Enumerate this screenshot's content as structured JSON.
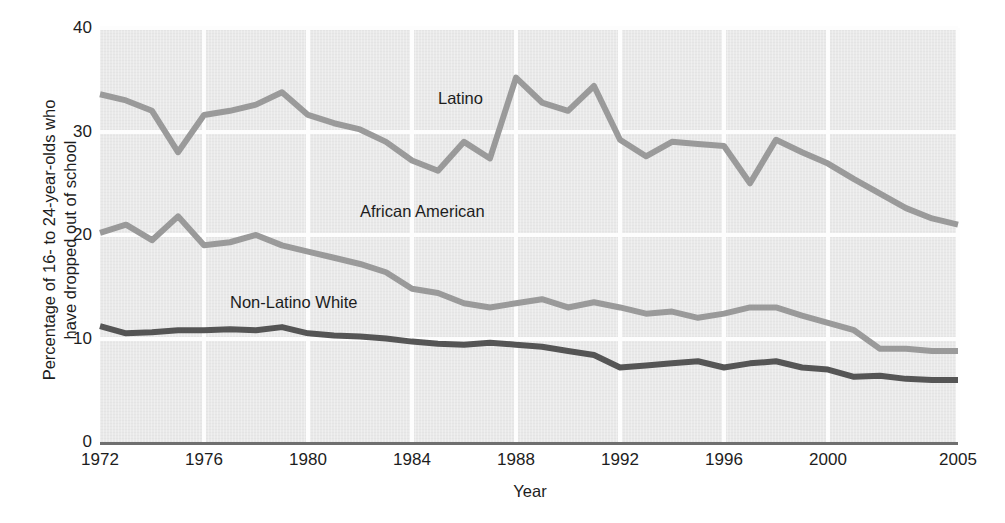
{
  "chart_data": {
    "type": "line",
    "title": "",
    "xlabel": "Year",
    "ylabel_line1": "Percentage of 16- to 24-year-olds who",
    "ylabel_line2": "have dropped out of school",
    "xlim": [
      1972,
      2005
    ],
    "ylim": [
      0,
      40
    ],
    "xticks": [
      "1972",
      "1976",
      "1980",
      "1984",
      "1988",
      "1992",
      "1996",
      "2000",
      "2005"
    ],
    "xtick_values": [
      1972,
      1976,
      1980,
      1984,
      1988,
      1992,
      1996,
      2000,
      2005
    ],
    "yticks": [
      "0",
      "10",
      "20",
      "30",
      "40"
    ],
    "ytick_values": [
      0,
      10,
      20,
      30,
      40
    ],
    "grid": "both-major-white",
    "legend": "inline-labels",
    "x": [
      1972,
      1973,
      1974,
      1975,
      1976,
      1977,
      1978,
      1979,
      1980,
      1981,
      1982,
      1983,
      1984,
      1985,
      1986,
      1987,
      1988,
      1989,
      1990,
      1991,
      1992,
      1993,
      1994,
      1995,
      1996,
      1997,
      1998,
      1999,
      2000,
      2001,
      2002,
      2003,
      2004,
      2005
    ],
    "series": [
      {
        "name": "Latino",
        "color": "#9a9a9a",
        "label_x": 1985.0,
        "label_y": 33.0,
        "values": [
          33.6,
          33.0,
          32.0,
          28.0,
          31.6,
          32.0,
          32.6,
          33.8,
          31.6,
          30.8,
          30.2,
          29.0,
          27.2,
          26.2,
          29.0,
          27.4,
          35.2,
          32.8,
          32.0,
          34.4,
          29.2,
          27.6,
          29.0,
          28.8,
          28.6,
          25.0,
          29.2,
          28.0,
          26.9,
          25.4,
          24.0,
          22.6,
          21.6,
          21.0
        ]
      },
      {
        "name": "African American",
        "color": "#9a9a9a",
        "label_x": 1982.0,
        "label_y": 22.1,
        "values": [
          20.2,
          21.0,
          19.5,
          21.8,
          19.0,
          19.3,
          20.0,
          19.0,
          18.4,
          17.8,
          17.2,
          16.4,
          14.8,
          14.4,
          13.4,
          13.0,
          13.4,
          13.8,
          13.0,
          13.5,
          13.0,
          12.4,
          12.6,
          12.0,
          12.4,
          13.0,
          13.0,
          12.2,
          11.5,
          10.8,
          9.0,
          9.0,
          8.8,
          8.8
        ]
      },
      {
        "name": "Non-Latino White",
        "color": "#555555",
        "label_x": 1977.0,
        "label_y": 13.3,
        "values": [
          11.2,
          10.5,
          10.6,
          10.8,
          10.8,
          10.9,
          10.8,
          11.1,
          10.5,
          10.3,
          10.2,
          10.0,
          9.7,
          9.5,
          9.4,
          9.6,
          9.4,
          9.2,
          8.8,
          8.4,
          7.2,
          7.4,
          7.6,
          7.8,
          7.2,
          7.6,
          7.8,
          7.2,
          7.0,
          6.3,
          6.4,
          6.1,
          6.0,
          6.0
        ]
      }
    ]
  }
}
